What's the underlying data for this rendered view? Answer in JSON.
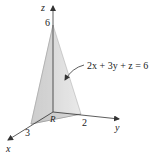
{
  "figure": {
    "type": "3d-tetrahedron",
    "plane_equation": "2x + 3y + z = 6",
    "region_label": "R",
    "axes": {
      "x": {
        "label": "x",
        "intercept_label": "3"
      },
      "y": {
        "label": "y",
        "intercept_label": "2"
      },
      "z": {
        "label": "z",
        "intercept_label": "6"
      }
    },
    "colors": {
      "face_left": "#d6d6d6",
      "face_right": "#bdbdbd",
      "base": "#9a9a9a",
      "axis": "#333333"
    }
  }
}
